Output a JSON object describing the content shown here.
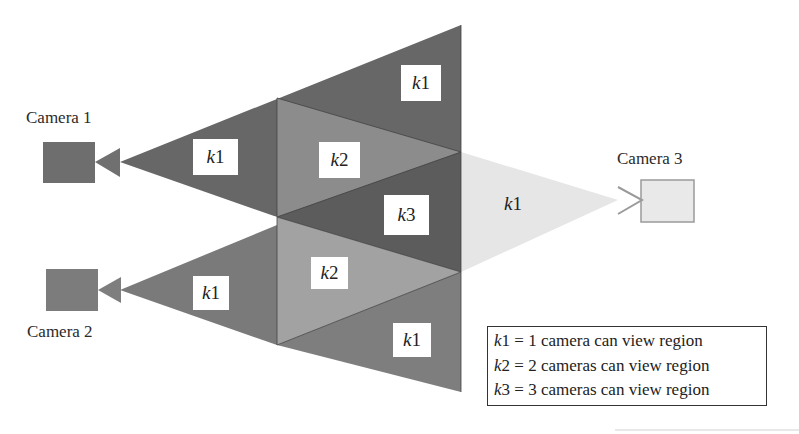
{
  "cameras": [
    {
      "id": 1,
      "label": "Camera 1",
      "color": "#6e6e6e"
    },
    {
      "id": 2,
      "label": "Camera 2",
      "color": "#7b7b7b"
    },
    {
      "id": 3,
      "label": "Camera 3",
      "color": "#e6e6e6"
    }
  ],
  "regions": [
    {
      "name": "cam1-only",
      "label_k": "k",
      "label_n": "1",
      "color": "#6a6a6a"
    },
    {
      "name": "top-only",
      "label_k": "k",
      "label_n": "1",
      "color": "#6a6a6a"
    },
    {
      "name": "overlap-12-top",
      "label_k": "k",
      "label_n": "2",
      "color": "#8a8a8a"
    },
    {
      "name": "overlap-123",
      "label_k": "k",
      "label_n": "3",
      "color": "#5e5e5e"
    },
    {
      "name": "cam3-only",
      "label_k": "k",
      "label_n": "1",
      "color": "#e8e8e8"
    },
    {
      "name": "cam2-only",
      "label_k": "k",
      "label_n": "1",
      "color": "#7e7e7e"
    },
    {
      "name": "overlap-12-bottom",
      "label_k": "k",
      "label_n": "2",
      "color": "#9e9e9e"
    },
    {
      "name": "bottom-only",
      "label_k": "k",
      "label_n": "1",
      "color": "#808080"
    }
  ],
  "legend": [
    {
      "k": "k",
      "n": "1",
      "text": " = 1 camera can view region"
    },
    {
      "k": "k",
      "n": "2",
      "text": " = 2 cameras can view region"
    },
    {
      "k": "k",
      "n": "3",
      "text": " = 3 cameras can view region"
    }
  ]
}
